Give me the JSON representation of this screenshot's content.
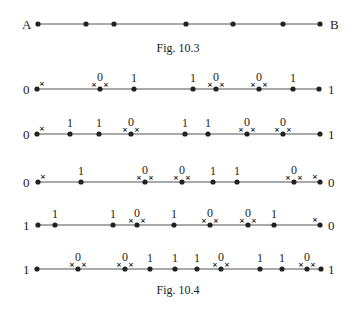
{
  "fig103": {
    "caption": "Fig. 10.3",
    "left_label": "A",
    "right_label": "B",
    "y": 24,
    "x_start": 38,
    "x_end": 320,
    "points": [
      38,
      86,
      114,
      186,
      233,
      283,
      320
    ]
  },
  "fig104": {
    "caption": "Fig. 10.4",
    "x_start": 37,
    "x_end": 320,
    "rows": [
      {
        "y": 89,
        "left": "0",
        "right": "1",
        "points": [
          {
            "x": 37,
            "x_right": true
          },
          {
            "x": 100,
            "label": "0",
            "cross": true
          },
          {
            "x": 134,
            "label": "1"
          },
          {
            "x": 193,
            "label": "1"
          },
          {
            "x": 216,
            "label": "0",
            "cross": true
          },
          {
            "x": 259,
            "label": "0",
            "cross": true
          },
          {
            "x": 293,
            "label": "1"
          },
          {
            "x": 319
          }
        ]
      },
      {
        "y": 134,
        "left": "0",
        "right": "1",
        "points": [
          {
            "x": 37,
            "x_right": true
          },
          {
            "x": 70,
            "label": "1"
          },
          {
            "x": 99,
            "label": "1"
          },
          {
            "x": 131,
            "label": "0",
            "cross": true
          },
          {
            "x": 185,
            "label": "1"
          },
          {
            "x": 208,
            "label": "1"
          },
          {
            "x": 247,
            "label": "0",
            "cross": true
          },
          {
            "x": 283,
            "label": "0",
            "cross": true
          },
          {
            "x": 320
          }
        ]
      },
      {
        "y": 182,
        "left": "0",
        "right": "0",
        "points": [
          {
            "x": 38,
            "x_right": true
          },
          {
            "x": 81,
            "label": "1"
          },
          {
            "x": 145,
            "label": "0",
            "cross": true
          },
          {
            "x": 182,
            "label": "0",
            "cross": true
          },
          {
            "x": 213,
            "label": "1"
          },
          {
            "x": 237,
            "label": "1"
          },
          {
            "x": 294,
            "label": "0",
            "cross": true
          },
          {
            "x": 320,
            "x_left": true
          }
        ]
      },
      {
        "y": 225,
        "left": "1",
        "right": "0",
        "points": [
          {
            "x": 38
          },
          {
            "x": 55,
            "label": "1"
          },
          {
            "x": 113,
            "label": "1"
          },
          {
            "x": 137,
            "label": "0",
            "cross": true
          },
          {
            "x": 174,
            "label": "1"
          },
          {
            "x": 210,
            "label": "0",
            "cross": true
          },
          {
            "x": 248,
            "label": "0",
            "cross": true
          },
          {
            "x": 274,
            "label": "1"
          },
          {
            "x": 320,
            "x_left": true
          }
        ]
      },
      {
        "y": 269,
        "left": "1",
        "right": "1",
        "points": [
          {
            "x": 37
          },
          {
            "x": 78,
            "label": "0",
            "cross": true
          },
          {
            "x": 125,
            "label": "0",
            "cross": true
          },
          {
            "x": 150,
            "label": "1"
          },
          {
            "x": 175,
            "label": "1"
          },
          {
            "x": 197,
            "label": "1"
          },
          {
            "x": 221,
            "label": "0",
            "cross": true
          },
          {
            "x": 260,
            "label": "1"
          },
          {
            "x": 282,
            "label": "1"
          },
          {
            "x": 307,
            "label": "0",
            "cross": true
          },
          {
            "x": 321
          }
        ]
      }
    ]
  },
  "colors": {
    "ink": "#222222",
    "line": "#555555",
    "background": "#ffffff"
  }
}
